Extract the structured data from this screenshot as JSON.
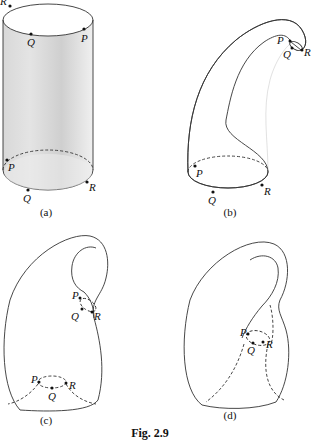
{
  "figure": {
    "caption": "Fig. 2.9",
    "panels": [
      {
        "id": "a",
        "label": "(a)",
        "shape": "cylinder",
        "points": [
          "R",
          "Q",
          "P",
          "P",
          "Q",
          "R"
        ]
      },
      {
        "id": "b",
        "label": "(b)",
        "shape": "bent tube (horn)",
        "points": [
          "P",
          "Q",
          "R",
          "P",
          "Q",
          "R"
        ]
      },
      {
        "id": "c",
        "label": "(c)",
        "shape": "tube passing toward base",
        "points": [
          "P",
          "Q",
          "R",
          "P",
          "Q",
          "R"
        ]
      },
      {
        "id": "d",
        "label": "(d)",
        "shape": "Klein bottle",
        "points": [
          "P",
          "Q",
          "R"
        ]
      }
    ]
  },
  "colors": {
    "surface_light": "#f2f2f2",
    "surface_shade": "#bdbdbd",
    "edge": "#333333",
    "text": "#111111"
  }
}
